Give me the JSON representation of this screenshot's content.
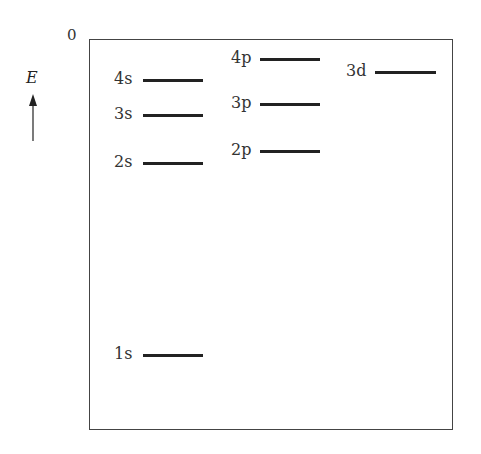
{
  "diagram": {
    "zero_label": "0",
    "axis_label": "E",
    "levels": [
      {
        "name": "4s",
        "x": 143,
        "y": 80,
        "w": 60
      },
      {
        "name": "3s",
        "x": 143,
        "y": 115,
        "w": 60
      },
      {
        "name": "2s",
        "x": 143,
        "y": 163,
        "w": 60
      },
      {
        "name": "1s",
        "x": 143,
        "y": 355,
        "w": 60
      },
      {
        "name": "4p",
        "x": 260,
        "y": 59,
        "w": 60
      },
      {
        "name": "3p",
        "x": 260,
        "y": 104,
        "w": 60
      },
      {
        "name": "2p",
        "x": 260,
        "y": 151,
        "w": 60
      },
      {
        "name": "3d",
        "x": 375,
        "y": 72,
        "w": 61
      }
    ]
  }
}
